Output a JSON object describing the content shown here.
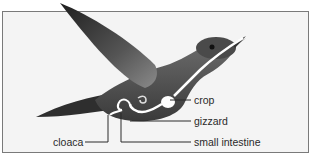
{
  "diagram": {
    "labels": {
      "crop": "crop",
      "gizzard": "gizzard",
      "small_intestine": "small intestine",
      "cloaca": "cloaca"
    },
    "colors": {
      "background": "#f4f4f4",
      "frame_border": "#7a7a7a",
      "bird_body": "#5a5a5a",
      "digestive_tract": "#ffffff",
      "leader_line": "#2a2a2a"
    }
  }
}
